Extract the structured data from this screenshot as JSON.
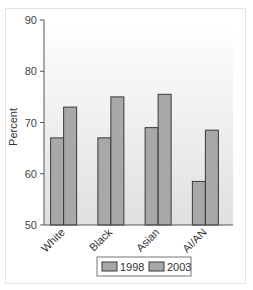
{
  "chart_data": {
    "type": "bar",
    "title": "",
    "xlabel": "",
    "ylabel": "Percent",
    "ylim": [
      50,
      90
    ],
    "yticks": [
      50,
      60,
      70,
      80,
      90
    ],
    "categories": [
      "White",
      "Black",
      "Asian",
      "AI/AN"
    ],
    "series": [
      {
        "name": "1998",
        "values": [
          67,
          67,
          69,
          58.5
        ],
        "color": "#a8a8a8"
      },
      {
        "name": "2003",
        "values": [
          73,
          75,
          75.5,
          68.5
        ],
        "color": "#a8a8a8"
      }
    ],
    "grid": false,
    "legend_position": "bottom",
    "background_gradient": [
      "#ffffff",
      "#e2e2e2"
    ]
  },
  "legend": {
    "items": [
      {
        "label": "1998"
      },
      {
        "label": "2003"
      }
    ]
  },
  "axis": {
    "y_title": "Percent",
    "y_ticks": [
      "90",
      "80",
      "70",
      "60",
      "50"
    ]
  }
}
